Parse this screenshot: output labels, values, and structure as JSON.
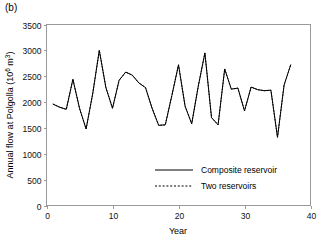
{
  "panel": {
    "label": "(b)"
  },
  "chart_data": {
    "type": "line",
    "title": "",
    "xlabel": "Year",
    "ylabel": "Annual flow at Polgolla (10⁶ m³)",
    "ylabel_main": "Annual flow at Polgolla (10",
    "ylabel_exp": "6",
    "ylabel_tail": " m",
    "ylabel_exp2": "3",
    "ylabel_close": ")",
    "xlim": [
      0,
      40
    ],
    "ylim": [
      0,
      3500
    ],
    "xticks": [
      0,
      10,
      20,
      30,
      40
    ],
    "xticklabels": [
      "0",
      "10",
      "20",
      "30",
      "40"
    ],
    "yticks": [
      0,
      500,
      1000,
      1500,
      2000,
      2500,
      3000,
      3500
    ],
    "yticklabels": [
      "0",
      "500",
      "1000",
      "1500",
      "2000",
      "2500",
      "3000",
      "3500"
    ],
    "grid": false,
    "legend_position": "inside-lower-right",
    "x": [
      1,
      2,
      3,
      4,
      5,
      6,
      7,
      8,
      9,
      10,
      11,
      12,
      13,
      14,
      15,
      16,
      17,
      18,
      19,
      20,
      21,
      22,
      23,
      24,
      25,
      26,
      27,
      28,
      29,
      30,
      31,
      32,
      33,
      34,
      35,
      36,
      37
    ],
    "series": [
      {
        "name": "Composite reservoir",
        "style": "solid",
        "color": "#000000",
        "values": [
          1960,
          1900,
          1860,
          2440,
          1880,
          1480,
          2160,
          3000,
          2280,
          1880,
          2420,
          2580,
          2520,
          2370,
          2280,
          1880,
          1550,
          1560,
          2130,
          2720,
          1920,
          1580,
          2310,
          2950,
          1700,
          1560,
          2640,
          2250,
          2270,
          1830,
          2290,
          2240,
          2220,
          2230,
          1320,
          2330,
          2720
        ]
      },
      {
        "name": "Two reservoirs",
        "style": "dashed",
        "color": "#000000",
        "values": [
          1960,
          1900,
          1860,
          2440,
          1880,
          1480,
          2160,
          3000,
          2280,
          1880,
          2420,
          2580,
          2520,
          2370,
          2280,
          1880,
          1550,
          1560,
          2130,
          2720,
          1920,
          1580,
          2310,
          2950,
          1700,
          1560,
          2640,
          2250,
          2270,
          1830,
          2290,
          2240,
          2220,
          2230,
          1320,
          2330,
          2720
        ]
      }
    ],
    "legend": [
      {
        "label": "Composite reservoir",
        "style": "solid"
      },
      {
        "label": "Two reservoirs",
        "style": "dashed"
      }
    ]
  }
}
